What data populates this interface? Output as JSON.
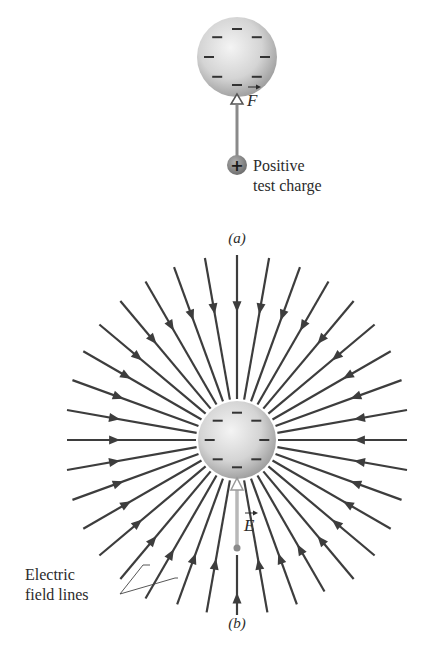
{
  "panel_a": {
    "caption": "(a)",
    "sphere": {
      "cx": 237,
      "cy": 57,
      "r": 40,
      "charge_sign": "−",
      "charge_count": 8
    },
    "force_vector_label": "F",
    "test_charge": {
      "symbol": "+",
      "label_line1": "Positive",
      "label_line2": "test charge"
    }
  },
  "panel_b": {
    "caption": "(b)",
    "sphere": {
      "cx": 237,
      "cy": 440,
      "r": 39,
      "charge_sign": "−",
      "charge_count": 8
    },
    "field_vector_label": "E",
    "field_line_count": 36,
    "field_line_direction": "inward",
    "annotation": {
      "line1": "Electric",
      "line2": "field lines"
    }
  },
  "colors": {
    "line": "#3d3d3d",
    "sphere_light": "#f2f2f2",
    "sphere_dark": "#9a9a9a",
    "vector_gray": "#a8a8a8",
    "test_charge": "#7d7d7d",
    "text": "#2b2b2b"
  }
}
